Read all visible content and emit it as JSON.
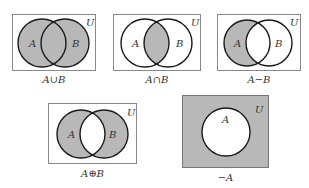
{
  "colors": {
    "shade": "#b8b8b8",
    "line": "#1a1a1a",
    "box": "#888888",
    "background": "#ffffff"
  },
  "universe_label": "U",
  "diagrams": [
    {
      "id": "union",
      "caption": "A∪B",
      "set_a": "A",
      "set_b": "B",
      "shaded": "A or B"
    },
    {
      "id": "intersection",
      "caption": "A∩B",
      "set_a": "A",
      "set_b": "B",
      "shaded": "A and B"
    },
    {
      "id": "difference",
      "caption": "A−B",
      "set_a": "A",
      "set_b": "B",
      "shaded": "A only"
    },
    {
      "id": "symmetric-difference",
      "caption": "A⊕B",
      "set_a": "A",
      "set_b": "B",
      "shaded": "A xor B"
    },
    {
      "id": "complement",
      "caption": "−A",
      "set_a": "A",
      "shaded": "outside A"
    }
  ]
}
